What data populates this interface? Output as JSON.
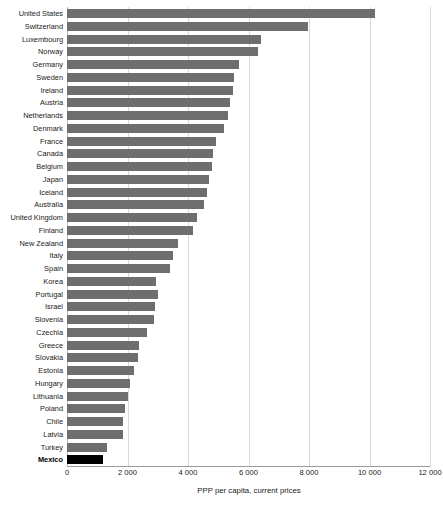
{
  "chart_data": {
    "type": "bar",
    "orientation": "horizontal",
    "title": "",
    "subtitle": "",
    "xlabel": "PPP per capita, current prices",
    "ylabel": "",
    "xlim": [
      0,
      12000
    ],
    "xticks": [
      0,
      2000,
      4000,
      6000,
      8000,
      10000,
      12000
    ],
    "xtick_labels": [
      "0",
      "2 000",
      "4 000",
      "6 000",
      "8 000",
      "10 000",
      "12 000"
    ],
    "grid": "vertical",
    "legend": "none",
    "bar_color": "#6e6e6e",
    "highlight_color": "#000000",
    "highlight_category": "Mexico",
    "categories": [
      "United States",
      "Switzerland",
      "Luxembourg",
      "Norway",
      "Germany",
      "Sweden",
      "Ireland",
      "Austria",
      "Netherlands",
      "Denmark",
      "France",
      "Canada",
      "Belgium",
      "Japan",
      "Iceland",
      "Australia",
      "United Kingdom",
      "Finland",
      "New Zealand",
      "Italy",
      "Spain",
      "Korea",
      "Portugal",
      "Israel",
      "Slovenia",
      "Czechia",
      "Greece",
      "Slovakia",
      "Estonia",
      "Hungary",
      "Lithuania",
      "Poland",
      "Chile",
      "Latvia",
      "Turkey",
      "Mexico"
    ],
    "values": [
      10180,
      7970,
      6410,
      6310,
      5690,
      5520,
      5480,
      5390,
      5320,
      5190,
      4930,
      4830,
      4790,
      4700,
      4630,
      4530,
      4290,
      4180,
      3680,
      3510,
      3420,
      2950,
      3000,
      2910,
      2880,
      2650,
      2390,
      2350,
      2210,
      2080,
      2020,
      1930,
      1860,
      1860,
      1320,
      1190
    ]
  }
}
